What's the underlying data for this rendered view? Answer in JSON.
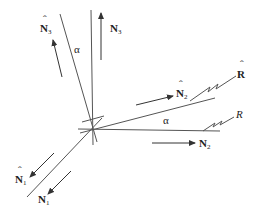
{
  "diagram": {
    "type": "vector-rotation",
    "origin": [
      92,
      128
    ],
    "angle_label": "α",
    "vectors": {
      "N1": {
        "label": "N",
        "sub": "1",
        "hat": false
      },
      "N1_hat": {
        "label": "N",
        "sub": "1",
        "hat": true
      },
      "N2": {
        "label": "N",
        "sub": "2",
        "hat": false
      },
      "N2_hat": {
        "label": "N",
        "sub": "2",
        "hat": true
      },
      "N3": {
        "label": "N",
        "sub": "3",
        "hat": false
      },
      "N3_hat": {
        "label": "N",
        "sub": "3",
        "hat": true
      },
      "R": {
        "label": "R",
        "italic": true
      },
      "R_hat": {
        "label": "R",
        "hat": true
      }
    },
    "colors": {
      "axis": "#555555",
      "arrow": "#333333",
      "text": "#222222"
    }
  },
  "labels": {
    "alpha_top": "α",
    "alpha_right": "α",
    "n3": "N",
    "n3_sub": "3",
    "n3hat": "N",
    "n3hat_sub": "3",
    "n2hat": "N",
    "n2hat_sub": "2",
    "n2": "N",
    "n2_sub": "2",
    "n1hat": "N",
    "n1hat_sub": "1",
    "n1": "N",
    "n1_sub": "1",
    "r_hat": "R",
    "r": "R",
    "hat": "ˆ"
  }
}
